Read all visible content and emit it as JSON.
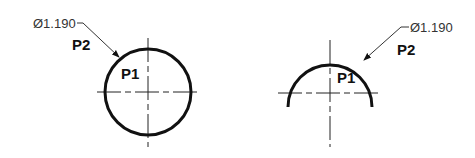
{
  "figures": [
    {
      "id": "full-circle",
      "dimension": "Ø1.190",
      "label_outer": "P2",
      "label_inner": "P1",
      "shape": "circle"
    },
    {
      "id": "partial-arc",
      "dimension": "Ø1.190",
      "label_outer": "P2",
      "label_inner": "P1",
      "shape": "arc"
    }
  ],
  "colors": {
    "background": "#ffffff",
    "line": "#111111"
  }
}
